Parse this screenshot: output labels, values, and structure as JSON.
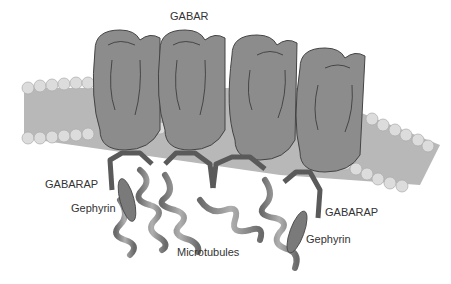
{
  "diagram": {
    "labels": {
      "gabar": "GABAR",
      "gabarap_left": "GABARAP",
      "gabarap_right": "GABARAP",
      "gephyrin_left": "Gephyrin",
      "gephyrin_right": "Gephyrin",
      "microtubules": "Microtubules"
    },
    "colors": {
      "receptor": "#8c8c8c",
      "receptor_outline": "#444444",
      "membrane": "#b8b8b8",
      "lipid_head": "#dcdcdc",
      "gabarap": "#5a5a5a",
      "gephyrin": "#7a7a7a",
      "microtubule": "#888888",
      "text": "#333333"
    }
  }
}
